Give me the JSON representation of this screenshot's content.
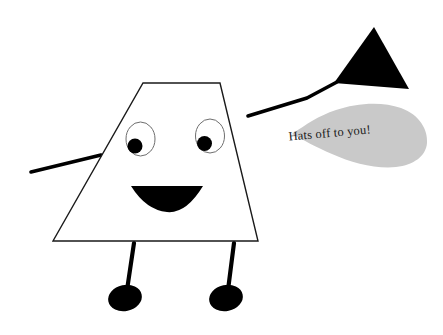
{
  "scene": {
    "title": "Hats off to you",
    "width": 443,
    "height": 335,
    "background_color": "#ffffff"
  },
  "colors": {
    "outline": "#1a1a1a",
    "fill_body": "#ffffff",
    "black": "#000000",
    "bubble_gray": "#c9c9c9",
    "text": "#1a1a1a"
  },
  "character": {
    "name": "trapezoid-person",
    "body": {
      "shape": "trapezoid",
      "points": "143,83 220,83 258,241 53,241",
      "fill": "#ffffff",
      "stroke": "#1a1a1a",
      "stroke_width": 1.4
    },
    "face": {
      "left_eye": {
        "cx": 140.5,
        "cy": 139,
        "rx": 14.5,
        "ry": 17,
        "pupil": {
          "cx": 135,
          "cy": 146,
          "r": 7.5
        }
      },
      "right_eye": {
        "cx": 210,
        "cy": 136,
        "rx": 14.5,
        "ry": 17,
        "pupil": {
          "cx": 204.5,
          "cy": 143.5,
          "r": 7.5
        }
      },
      "mouth": {
        "shape": "crescent-smile",
        "path": "M131,186 L203,186 Q186,214 167,212 Q146,210 131,186 Z"
      }
    },
    "left_arm": {
      "x1": 101,
      "y1": 155,
      "x2": 31,
      "y2": 172,
      "stroke_width": 3.6
    },
    "right_arm": {
      "points": "248,116 307,98 337,82",
      "stroke_width": 3.6
    },
    "left_leg": {
      "stem": {
        "x1": 134,
        "y1": 243,
        "x2": 127,
        "y2": 290,
        "stroke_width": 4.2
      },
      "foot": {
        "cx": 125,
        "cy": 298,
        "rx": 17,
        "ry": 13,
        "rotation": -12
      }
    },
    "right_leg": {
      "stem": {
        "x1": 234,
        "y1": 243,
        "x2": 228,
        "y2": 290,
        "stroke_width": 4.2
      },
      "foot": {
        "cx": 226,
        "cy": 298,
        "rx": 17,
        "ry": 13,
        "rotation": -12
      }
    }
  },
  "hat": {
    "name": "top-hat-triangle",
    "shape": "triangle",
    "points": "374,27 409,89 334,83",
    "fill": "#000000"
  },
  "speech_bubble": {
    "name": "speech-bubble",
    "shape": "teardrop",
    "fill": "#c9c9c9",
    "text": "Hats off to you!",
    "text_x": 330,
    "text_y": 137,
    "text_rotation": -5,
    "path": "M292,134 C307,124 318,116 336,110 C356,103 382,101 401,108 C420,115 428,130 427,143 C426,156 414,165 396,167 C376,169 352,163 332,154 C316,147 303,140 292,134 Z"
  }
}
